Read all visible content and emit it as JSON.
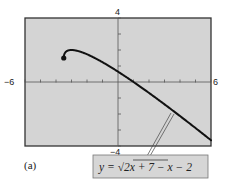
{
  "chart_data": {
    "type": "line",
    "title": "",
    "panel_label": "(a)",
    "equation_label": {
      "prefix": "y = ",
      "radicand": "2x + 7",
      "suffix": " − x − 2"
    },
    "function": "y = sqrt(2x + 7) - x - 2",
    "domain": [
      -3.5,
      6
    ],
    "start_point": {
      "x": -3.5,
      "y": 1.5,
      "marker": "filled-circle"
    },
    "xlim": [
      -6,
      6
    ],
    "ylim": [
      -4,
      4
    ],
    "x_tick_step": 1,
    "y_tick_step": 1,
    "tick_labels": {
      "xmin": "−6",
      "xmax": "6",
      "ymax": "4",
      "ymin": "−4"
    },
    "sample_points": [
      {
        "x": -3.5,
        "y": 1.5
      },
      {
        "x": -3,
        "y": 2.0
      },
      {
        "x": -2,
        "y": 1.73
      },
      {
        "x": -1,
        "y": 1.24
      },
      {
        "x": 0,
        "y": 0.65
      },
      {
        "x": 1,
        "y": 0.0
      },
      {
        "x": 2,
        "y": -0.68
      },
      {
        "x": 3,
        "y": -1.39
      },
      {
        "x": 4,
        "y": -2.13
      },
      {
        "x": 5,
        "y": -2.88
      },
      {
        "x": 6,
        "y": -3.65
      }
    ],
    "grid": false,
    "background": "#d3d3d3",
    "line_color": "#111111"
  }
}
